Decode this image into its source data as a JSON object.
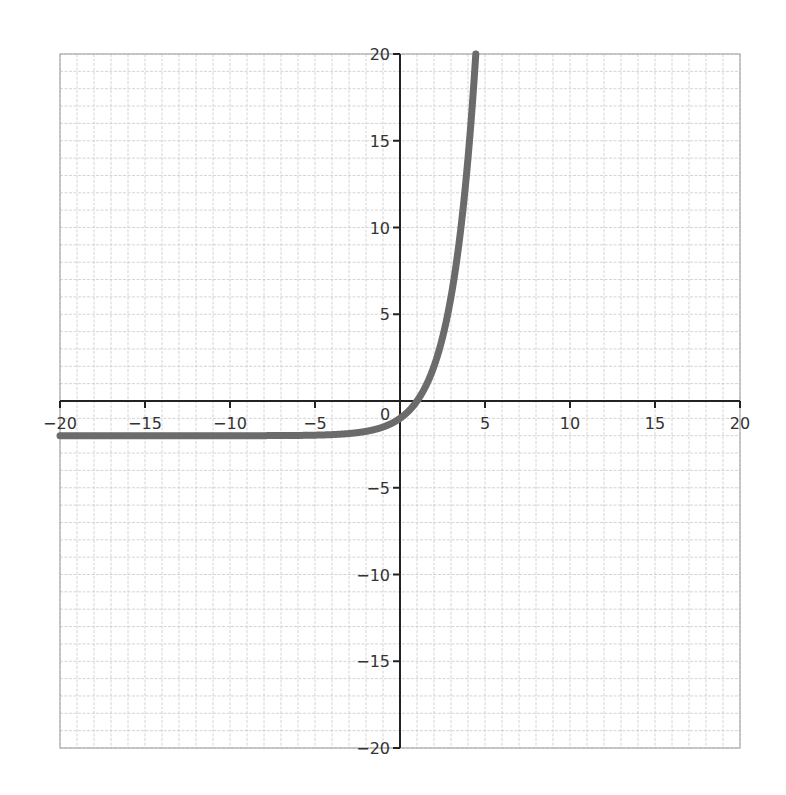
{
  "chart_data": {
    "type": "line",
    "title": "",
    "xlabel": "",
    "ylabel": "",
    "xlim": [
      -20,
      20
    ],
    "ylim": [
      -20,
      20
    ],
    "grid": true,
    "grid_minor_step": 1,
    "x_ticks": [
      -20,
      -15,
      -10,
      -5,
      5,
      10,
      15,
      20
    ],
    "x_tick_labels": [
      "−20",
      "−15",
      "−10",
      "−5",
      "5",
      "10",
      "15",
      "20"
    ],
    "y_ticks": [
      20,
      15,
      10,
      5,
      -5,
      -10,
      -15,
      -20
    ],
    "y_tick_labels": [
      "20",
      "15",
      "10",
      "5",
      "−5",
      "−10",
      "−15",
      "−20"
    ],
    "origin_label": "0",
    "series": [
      {
        "name": "y = 2^x − 2",
        "color": "#6b6b6b",
        "x": [
          -20,
          -15,
          -10,
          -5,
          -3,
          -2,
          -1,
          0,
          0.5,
          1,
          1.5,
          2,
          2.5,
          3,
          3.5,
          4,
          4.25,
          4.46
        ],
        "y": [
          -2,
          -2,
          -2,
          -1.97,
          -1.88,
          -1.75,
          -1.5,
          -1,
          -0.59,
          0,
          0.83,
          2,
          3.66,
          6,
          9.31,
          14,
          17.03,
          20
        ]
      }
    ],
    "legend": null
  },
  "colors": {
    "grid_minor": "#c9c9c9",
    "axis": "#222222",
    "curve": "#6b6b6b",
    "frame": "#9a9a9a"
  }
}
